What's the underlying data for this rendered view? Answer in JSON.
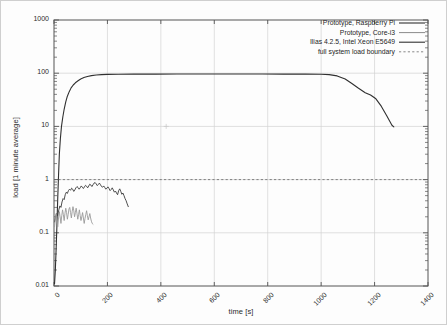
{
  "chart_data": {
    "type": "line",
    "title": "",
    "xlabel": "time [s]",
    "ylabel": "load [1 minute average]",
    "xlim": [
      0,
      1400
    ],
    "ylim": [
      0.01,
      1000
    ],
    "yscale": "log",
    "xscale": "linear",
    "grid": true,
    "legend_position": "top-right",
    "xticks": [
      "0",
      "200",
      "400",
      "600",
      "800",
      "1000",
      "1200",
      "1400"
    ],
    "xtick_values": [
      0,
      200,
      400,
      600,
      800,
      1000,
      1200,
      1400
    ],
    "yticks": [
      "0.01",
      "0.1",
      "1",
      "10",
      "100",
      "1000"
    ],
    "ytick_values": [
      0.01,
      0.1,
      1,
      10,
      100,
      1000
    ],
    "annotations": [
      {
        "text": "full system load boundary",
        "type": "hline",
        "y": 1.0,
        "style": "dashed"
      }
    ],
    "series": [
      {
        "name": "Prototype, Raspberry Pi",
        "style": "solid",
        "color": "#303030",
        "width": 1.1,
        "points": [
          [
            2,
            0.011
          ],
          [
            5,
            0.02
          ],
          [
            8,
            0.05
          ],
          [
            11,
            0.14
          ],
          [
            14,
            0.45
          ],
          [
            17,
            1.2
          ],
          [
            20,
            3.0
          ],
          [
            24,
            6.0
          ],
          [
            28,
            10.0
          ],
          [
            33,
            15.0
          ],
          [
            38,
            21.0
          ],
          [
            44,
            29.0
          ],
          [
            50,
            37.0
          ],
          [
            57,
            45.0
          ],
          [
            64,
            53.0
          ],
          [
            72,
            60.0
          ],
          [
            80,
            66.0
          ],
          [
            90,
            72.0
          ],
          [
            100,
            78.0
          ],
          [
            112,
            83.0
          ],
          [
            125,
            87.0
          ],
          [
            140,
            90.0
          ],
          [
            158,
            92.5
          ],
          [
            178,
            94.0
          ],
          [
            200,
            95.0
          ],
          [
            240,
            95.5
          ],
          [
            300,
            96.0
          ],
          [
            380,
            96.2
          ],
          [
            460,
            96.3
          ],
          [
            540,
            96.4
          ],
          [
            620,
            96.5
          ],
          [
            700,
            96.4
          ],
          [
            780,
            96.3
          ],
          [
            860,
            96.2
          ],
          [
            940,
            96.0
          ],
          [
            1000,
            95.5
          ],
          [
            1030,
            94.0
          ],
          [
            1060,
            89.0
          ],
          [
            1090,
            78.0
          ],
          [
            1115,
            64.0
          ],
          [
            1140,
            52.0
          ],
          [
            1165,
            43.0
          ],
          [
            1185,
            39.0
          ],
          [
            1205,
            33.0
          ],
          [
            1225,
            24.0
          ],
          [
            1245,
            16.0
          ],
          [
            1265,
            10.5
          ],
          [
            1272,
            9.8
          ]
        ]
      },
      {
        "name": "Prototype, Core-i3",
        "style": "solid",
        "color": "#3a3a3a",
        "width": 0.9,
        "points": [
          [
            2,
            0.16
          ],
          [
            6,
            0.2
          ],
          [
            10,
            0.23
          ],
          [
            14,
            0.21
          ],
          [
            18,
            0.27
          ],
          [
            22,
            0.32
          ],
          [
            26,
            0.3
          ],
          [
            30,
            0.38
          ],
          [
            34,
            0.44
          ],
          [
            38,
            0.42
          ],
          [
            42,
            0.52
          ],
          [
            46,
            0.58
          ],
          [
            50,
            0.55
          ],
          [
            54,
            0.62
          ],
          [
            58,
            0.66
          ],
          [
            62,
            0.63
          ],
          [
            66,
            0.69
          ],
          [
            70,
            0.66
          ],
          [
            74,
            0.6
          ],
          [
            78,
            0.64
          ],
          [
            82,
            0.7
          ],
          [
            86,
            0.74
          ],
          [
            90,
            0.71
          ],
          [
            94,
            0.66
          ],
          [
            98,
            0.7
          ],
          [
            102,
            0.76
          ],
          [
            106,
            0.72
          ],
          [
            110,
            0.68
          ],
          [
            114,
            0.73
          ],
          [
            118,
            0.78
          ],
          [
            122,
            0.75
          ],
          [
            126,
            0.7
          ],
          [
            130,
            0.76
          ],
          [
            134,
            0.82
          ],
          [
            138,
            0.79
          ],
          [
            142,
            0.74
          ],
          [
            146,
            0.8
          ],
          [
            150,
            0.86
          ],
          [
            154,
            0.88
          ],
          [
            158,
            0.83
          ],
          [
            162,
            0.77
          ],
          [
            166,
            0.81
          ],
          [
            170,
            0.86
          ],
          [
            174,
            0.8
          ],
          [
            178,
            0.74
          ],
          [
            182,
            0.72
          ],
          [
            186,
            0.76
          ],
          [
            190,
            0.71
          ],
          [
            194,
            0.66
          ],
          [
            198,
            0.69
          ],
          [
            202,
            0.73
          ],
          [
            206,
            0.68
          ],
          [
            210,
            0.62
          ],
          [
            214,
            0.65
          ],
          [
            218,
            0.7
          ],
          [
            222,
            0.64
          ],
          [
            226,
            0.58
          ],
          [
            230,
            0.61
          ],
          [
            234,
            0.56
          ],
          [
            238,
            0.52
          ],
          [
            242,
            0.62
          ],
          [
            246,
            0.67
          ],
          [
            250,
            0.6
          ],
          [
            254,
            0.53
          ],
          [
            258,
            0.56
          ],
          [
            262,
            0.5
          ],
          [
            266,
            0.44
          ],
          [
            270,
            0.4
          ],
          [
            274,
            0.35
          ],
          [
            278,
            0.31
          ]
        ]
      },
      {
        "name": "Ilias 4.2.5, Intel Xeon E5649",
        "style": "solid",
        "color": "#9a9a9a",
        "width": 0.9,
        "points": [
          [
            2,
            0.13
          ],
          [
            5,
            0.18
          ],
          [
            8,
            0.23
          ],
          [
            11,
            0.17
          ],
          [
            14,
            0.13
          ],
          [
            17,
            0.19
          ],
          [
            20,
            0.25
          ],
          [
            23,
            0.2
          ],
          [
            26,
            0.15
          ],
          [
            29,
            0.21
          ],
          [
            32,
            0.27
          ],
          [
            35,
            0.22
          ],
          [
            38,
            0.17
          ],
          [
            41,
            0.23
          ],
          [
            44,
            0.29
          ],
          [
            47,
            0.24
          ],
          [
            50,
            0.18
          ],
          [
            53,
            0.22
          ],
          [
            56,
            0.28
          ],
          [
            59,
            0.3
          ],
          [
            62,
            0.24
          ],
          [
            65,
            0.19
          ],
          [
            68,
            0.25
          ],
          [
            71,
            0.31
          ],
          [
            74,
            0.26
          ],
          [
            77,
            0.2
          ],
          [
            80,
            0.24
          ],
          [
            83,
            0.29
          ],
          [
            86,
            0.23
          ],
          [
            89,
            0.18
          ],
          [
            92,
            0.22
          ],
          [
            95,
            0.27
          ],
          [
            98,
            0.21
          ],
          [
            101,
            0.17
          ],
          [
            104,
            0.2
          ],
          [
            107,
            0.24
          ],
          [
            110,
            0.19
          ],
          [
            113,
            0.15
          ],
          [
            116,
            0.185
          ],
          [
            119,
            0.22
          ],
          [
            122,
            0.26
          ],
          [
            125,
            0.21
          ],
          [
            128,
            0.175
          ],
          [
            131,
            0.2
          ],
          [
            134,
            0.23
          ],
          [
            137,
            0.19
          ],
          [
            140,
            0.165
          ],
          [
            143,
            0.15
          ],
          [
            146,
            0.145
          ]
        ]
      }
    ]
  },
  "legend": {
    "items": [
      {
        "label": "Prototype, Raspberry Pi",
        "style": "solid",
        "color": "#303030"
      },
      {
        "label": "Prototype, Core-i3",
        "style": "solid",
        "color": "#6b6b6b"
      },
      {
        "label": "Ilias 4.2.5, Intel Xeon E5649",
        "style": "solid",
        "color": "#303030"
      },
      {
        "label": "full system load boundary",
        "style": "dashed",
        "color": "#6b6b6b"
      }
    ]
  },
  "colors": {
    "axis": "#555555",
    "grid": "#d2d2d2",
    "text": "#2b2b2b",
    "background": "#fdfdfd",
    "frame": "#cfcfcf"
  }
}
